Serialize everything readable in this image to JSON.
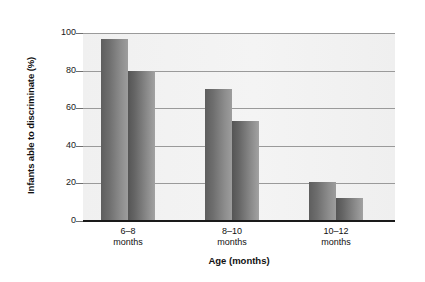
{
  "chart_data": {
    "type": "bar",
    "title": "",
    "xlabel": "Age (months)",
    "ylabel": "Infants able to discriminate (%)",
    "categories": [
      "6–8\nmonths",
      "8–10\nmonths",
      "10–12\nmonths"
    ],
    "category_lines": [
      {
        "line1": "6–8",
        "line2": "months"
      },
      {
        "line1": "8–10",
        "line2": "months"
      },
      {
        "line1": "10–12",
        "line2": "months"
      }
    ],
    "series": [
      {
        "name": "series-1",
        "values": [
          97,
          70,
          21
        ]
      },
      {
        "name": "series-2",
        "values": [
          80,
          53,
          12
        ]
      }
    ],
    "ylim": [
      0,
      100
    ],
    "yticks": [
      0,
      20,
      40,
      60,
      80,
      100
    ],
    "ytick_labels": [
      "0",
      "20",
      "40",
      "60",
      "80",
      "100"
    ],
    "grid": true,
    "legend": "none",
    "bar_color_dark": "#5e5e5e",
    "bar_color_light": "#9d9d9d",
    "plot_background": "#f2f2f2",
    "axis_color": "#1a1a1a",
    "gridline_color": "#9a9a9a"
  }
}
